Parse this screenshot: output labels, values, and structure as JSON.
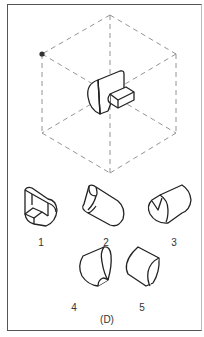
{
  "figure": {
    "caption": "(D)",
    "reference": {
      "description": "Isometric dashed cube wireframe containing a solid: half-cylinder block with a rectangular notch step",
      "marker": "dot-at-upper-left-vertex"
    },
    "options": [
      {
        "label": "1",
        "shape": "half-cylinder with inner step cut"
      },
      {
        "label": "2",
        "shape": "cylinder segment with curved notch"
      },
      {
        "label": "3",
        "shape": "cylinder with V-notch end"
      },
      {
        "label": "4",
        "shape": "cylinder with curled notch"
      },
      {
        "label": "5",
        "shape": "truncated cylinder segment"
      }
    ]
  },
  "colors": {
    "line": "#222222",
    "dash": "#888888",
    "border": "#555555"
  }
}
